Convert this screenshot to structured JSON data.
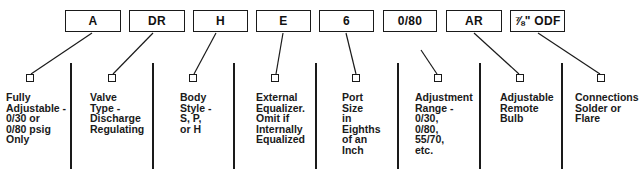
{
  "codes": [
    {
      "label": "A"
    },
    {
      "label": "DR"
    },
    {
      "label": "H"
    },
    {
      "label": "E"
    },
    {
      "label": "6"
    },
    {
      "label": "0/80"
    },
    {
      "label": "AR"
    },
    {
      "label": "⅞\" ODF"
    }
  ],
  "descriptions": [
    {
      "text": "Fully\nAdjustable -\n0/30 or\n0/80 psig\nOnly"
    },
    {
      "text": "Valve\nType -\nDischarge\nRegulating"
    },
    {
      "text": "Body\nStyle -\nS, P,\nor H"
    },
    {
      "text": "External\nEqualizer.\nOmit if\nInternally\nEqualized"
    },
    {
      "text": "Port\nSize\nin\nEighths\nof an\nInch"
    },
    {
      "text": "Adjustment\nRange -\n0/30,\n0/80,\n55/70,\netc."
    },
    {
      "text": "Adjustable\nRemote\nBulb"
    },
    {
      "text": "Connections\nSolder or\nFlare"
    }
  ],
  "colors": {
    "line": "#1a1a1a",
    "background": "#ffffff"
  }
}
